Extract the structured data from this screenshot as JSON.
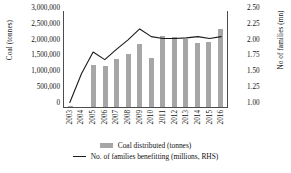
{
  "chart_data": {
    "type": "bar",
    "title": "",
    "xlabel": "",
    "ylabel": "Coal (tonnes)",
    "y2label": "No of families (mn)",
    "categories": [
      "2003",
      "2004",
      "2005",
      "2006",
      "2007",
      "2008",
      "2009",
      "2010",
      "2011",
      "2012",
      "2013",
      "2014",
      "2015",
      "2016"
    ],
    "ylim": [
      0,
      3000000
    ],
    "y2lim": [
      1.0,
      2.5
    ],
    "yticks": [
      "0",
      "500,000",
      "1,000,000",
      "1,500,000",
      "2,000,000",
      "2,500,000",
      "3,000,000"
    ],
    "y2ticks": [
      "1.00",
      "1.25",
      "1.50",
      "1.75",
      "2.00",
      "2.25",
      "2.50"
    ],
    "grid": false,
    "legend_position": "bottom",
    "series": [
      {
        "name": "Coal distributed (tonnes)",
        "type": "bar",
        "axis": "left",
        "color": "#a6a6a6",
        "values": [
          30000,
          0,
          1310000,
          1270000,
          1470000,
          1630000,
          1950000,
          1530000,
          2200000,
          2170000,
          2100000,
          1990000,
          2010000,
          2420000
        ]
      },
      {
        "name": "No. of families benefitting (millions, RHS)",
        "type": "line",
        "axis": "right",
        "color": "#1a1a1a",
        "values": [
          1.07,
          1.52,
          1.86,
          1.74,
          1.9,
          2.05,
          2.22,
          2.1,
          2.07,
          2.07,
          2.08,
          2.1,
          2.07,
          2.1
        ]
      }
    ]
  },
  "legend": {
    "items": [
      {
        "label": "Coal distributed (tonnes)",
        "marker": "bar-swatch"
      },
      {
        "label": "No. of families benefitting (millions, RHS)",
        "marker": "line-swatch"
      }
    ]
  }
}
